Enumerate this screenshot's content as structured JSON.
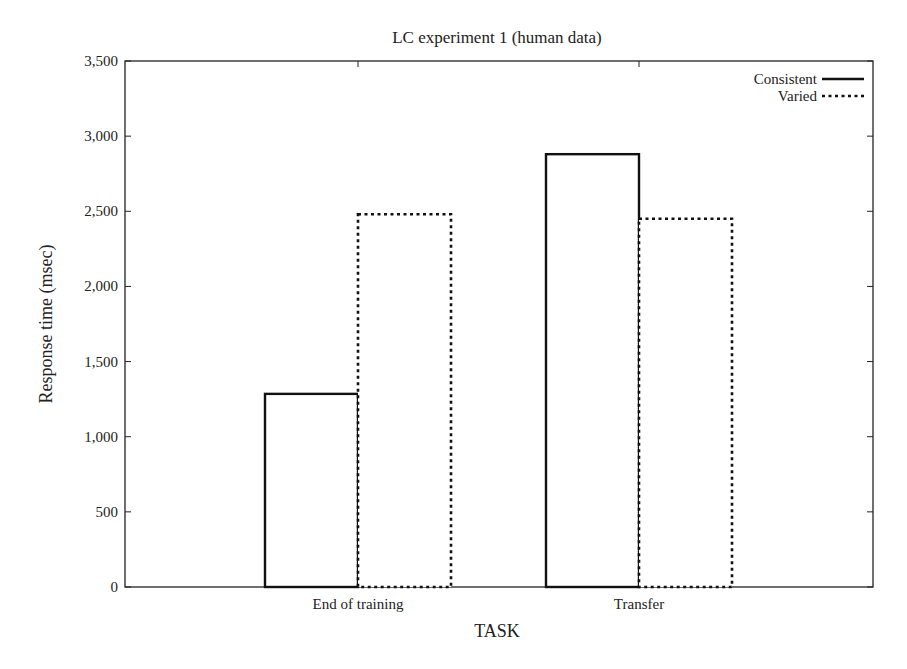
{
  "chart_data": {
    "type": "bar",
    "title": "LC experiment 1 (human data)",
    "xlabel": "TASK",
    "ylabel": "Response time (msec)",
    "categories": [
      "End of training",
      "Transfer"
    ],
    "series": [
      {
        "name": "Consistent",
        "style": "solid",
        "values": [
          1285,
          2880
        ]
      },
      {
        "name": "Varied",
        "style": "dotted",
        "values": [
          2480,
          2450
        ]
      }
    ],
    "ylim": [
      0,
      3500
    ],
    "yticks": [
      0,
      500,
      1000,
      1500,
      2000,
      2500,
      3000,
      3500
    ],
    "ytick_labels": [
      "0",
      "500",
      "1,000",
      "1,500",
      "2,000",
      "2,500",
      "3,000",
      "3,500"
    ],
    "grid": false,
    "legend_position": "top-right",
    "colors": {
      "axis": "#222222",
      "bar_fill": "#ffffff",
      "bar_stroke": "#111111"
    }
  }
}
